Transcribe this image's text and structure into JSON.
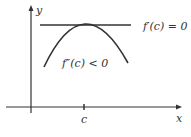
{
  "diagram": {
    "axes": {
      "x_label": "x",
      "y_label": "y",
      "tick_label": "c"
    },
    "tangent_label": "f′(c) = 0",
    "concavity_label": "f″(c) < 0",
    "colors": {
      "stroke": "#333333",
      "background": "#ffffff"
    }
  }
}
